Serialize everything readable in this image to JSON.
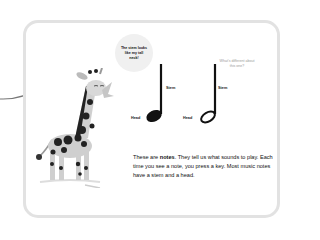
{
  "speech_bubble": {
    "text": "The stem looks like my tall neck!"
  },
  "side_note": {
    "text": "What's different about this one?"
  },
  "notes": [
    {
      "name": "quarter-note",
      "stem_label": "Stem",
      "head_label": "Head",
      "filled": true
    },
    {
      "name": "half-note",
      "stem_label": "Stem",
      "head_label": "Head",
      "filled": false
    }
  ],
  "body": {
    "part1": "These are ",
    "bold": "notes",
    "part2": ". They tell us what sounds to play. Each time you see a note, you press a key. Most music notes have a stem and a head."
  },
  "colors": {
    "card_border": "#e2e2e2",
    "bubble_bg": "#f0f0f0",
    "aside_text": "#9a9a9a",
    "ink": "#111111"
  }
}
